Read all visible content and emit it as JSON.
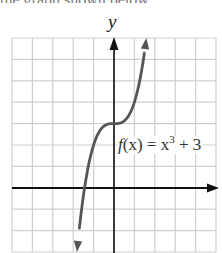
{
  "top_cutoff_text": "the graph shown below",
  "chart_data": {
    "type": "line",
    "title": "",
    "xlabel": "",
    "ylabel": "y",
    "xlim": [
      -5,
      5
    ],
    "ylim": [
      -3,
      7
    ],
    "grid": true,
    "grid_step": 1,
    "tick_labels": false,
    "function": "f(x) = x^3 + 3",
    "annotation": {
      "text_prefix": "f(x) = x",
      "exponent": "3",
      "text_suffix": " + 3",
      "position": {
        "x": 0.1,
        "y": 2.5
      }
    },
    "series": [
      {
        "name": "f(x) = x^3 + 3",
        "color": "#555555",
        "arrows": "both",
        "x": [
          -1.817,
          -1.6,
          -1.4,
          -1.2,
          -1.0,
          -0.8,
          -0.6,
          -0.4,
          -0.2,
          0.0,
          0.2,
          0.4,
          0.6,
          0.8,
          1.0,
          1.2,
          1.4,
          1.587
        ],
        "y": [
          -3.0,
          -1.096,
          0.256,
          1.272,
          2.0,
          2.488,
          2.784,
          2.936,
          2.992,
          3.0,
          3.008,
          3.064,
          3.216,
          3.512,
          4.0,
          4.728,
          5.744,
          7.0
        ]
      }
    ],
    "colors": {
      "axis": "#111111",
      "grid": "#cfcfcf",
      "curve": "#555555"
    }
  },
  "labels": {
    "y_axis": "y",
    "function_prefix": "f",
    "function_arg": "(x) = x",
    "function_exp": "3",
    "function_suffix": " + 3"
  }
}
